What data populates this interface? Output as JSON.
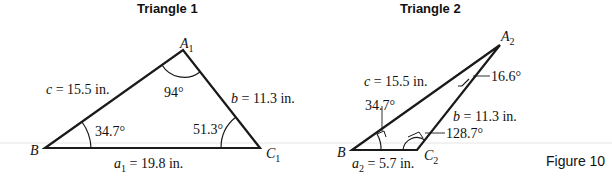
{
  "figure_label": "Figure 10",
  "triangle1": {
    "title": "Triangle 1",
    "vertices": {
      "A": "A",
      "A_sub": "1",
      "B": "B",
      "C": "C",
      "C_sub": "1"
    },
    "sides": {
      "c": {
        "var": "c",
        "text": " = 15.5 in."
      },
      "b": {
        "var": "b",
        "text": " = 11.3 in."
      },
      "a": {
        "var": "a",
        "sub": "1",
        "text": " = 19.8 in."
      }
    },
    "angles": {
      "A": "94°",
      "B": "34.7°",
      "C": "51.3°"
    }
  },
  "triangle2": {
    "title": "Triangle 2",
    "vertices": {
      "A": "A",
      "A_sub": "2",
      "B": "B",
      "C": "C",
      "C_sub": "2"
    },
    "sides": {
      "c": {
        "var": "c",
        "text": " = 15.5 in."
      },
      "b": {
        "var": "b",
        "text": " = 11.3 in."
      },
      "a": {
        "var": "a",
        "sub": "2",
        "text": " = 5.7 in."
      }
    },
    "angles": {
      "A": "16.6°",
      "B": "34.7°",
      "C": "128.7°"
    }
  }
}
